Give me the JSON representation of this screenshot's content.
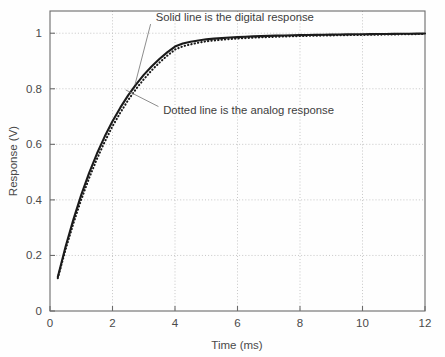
{
  "chart_data": {
    "type": "line",
    "title": "",
    "xlabel": "Time (ms)",
    "ylabel": "Response (V)",
    "xlim": [
      0,
      12
    ],
    "ylim": [
      0,
      1.08
    ],
    "grid": true,
    "legend_position": "none",
    "xticks": [
      0,
      2,
      4,
      6,
      8,
      10,
      12
    ],
    "xticklabels": [
      "0",
      "2",
      "4",
      "6",
      "8",
      "10",
      "12"
    ],
    "yticks": [
      0,
      0.2,
      0.4,
      0.6,
      0.8,
      1
    ],
    "yticklabels": [
      "0",
      "0.2",
      "0.4",
      "0.6",
      "0.8",
      "1"
    ],
    "x": [
      0.25,
      0.5,
      0.75,
      1.0,
      1.25,
      1.5,
      1.75,
      2.0,
      2.25,
      2.5,
      2.75,
      3.0,
      3.25,
      3.5,
      3.75,
      4.0,
      4.25,
      4.5,
      4.75,
      5.0,
      5.25,
      5.5,
      5.75,
      6.0,
      6.25,
      6.5,
      6.75,
      7.0,
      7.25,
      7.5,
      7.75,
      8.0,
      8.25,
      8.5,
      8.75,
      9.0,
      9.25,
      9.5,
      9.75,
      10.0,
      10.25,
      10.5,
      10.75,
      11.0,
      11.25,
      11.5,
      11.75,
      12.0
    ],
    "series": [
      {
        "name": "Solid line is the digital response",
        "style": "solid",
        "color": "#1b1b1b",
        "values": [
          0.122,
          0.232,
          0.33,
          0.418,
          0.496,
          0.566,
          0.628,
          0.683,
          0.732,
          0.776,
          0.815,
          0.85,
          0.88,
          0.907,
          0.931,
          0.952,
          0.963,
          0.969,
          0.974,
          0.978,
          0.9805,
          0.9825,
          0.9845,
          0.986,
          0.9875,
          0.9885,
          0.9895,
          0.9905,
          0.9912,
          0.9919,
          0.9925,
          0.993,
          0.9935,
          0.994,
          0.9945,
          0.995,
          0.9954,
          0.9958,
          0.9962,
          0.9965,
          0.9968,
          0.9971,
          0.9974,
          0.9977,
          0.998,
          0.9983,
          0.9986,
          0.9989
        ]
      },
      {
        "name": "Dotted line is the analog response",
        "style": "dotted",
        "color": "#1b1b1b",
        "values": [
          0.118,
          0.222,
          0.316,
          0.401,
          0.478,
          0.547,
          0.609,
          0.665,
          0.714,
          0.759,
          0.799,
          0.834,
          0.866,
          0.894,
          0.919,
          0.941,
          0.953,
          0.96,
          0.966,
          0.971,
          0.974,
          0.9765,
          0.979,
          0.981,
          0.9825,
          0.984,
          0.9852,
          0.9864,
          0.9874,
          0.9883,
          0.9891,
          0.9898,
          0.9905,
          0.9911,
          0.9917,
          0.9922,
          0.9927,
          0.9932,
          0.9937,
          0.9941,
          0.9945,
          0.9949,
          0.9953,
          0.9957,
          0.9961,
          0.9965,
          0.9969,
          0.9973
        ]
      }
    ],
    "annotations": [
      {
        "text": "Solid line is the digital response",
        "text_x": 3.38,
        "text_y": 1.058,
        "leader_from_x": 3.22,
        "leader_from_y": 1.033,
        "leader_to_x": 2.72,
        "leader_to_y": 0.815
      },
      {
        "text": "Dotted line is the analog response",
        "text_x": 3.62,
        "text_y": 0.722,
        "leader_from_x": 3.47,
        "leader_from_y": 0.736,
        "leader_to_x": 2.42,
        "leader_to_y": 0.796
      }
    ]
  }
}
